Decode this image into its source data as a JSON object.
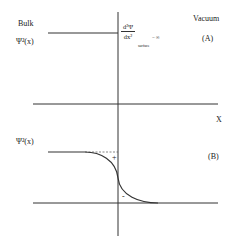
{
  "panel_a": {
    "bulk_label": "Bulk",
    "y_label": "Ψ²(x)",
    "vacuum_label": "Vacuum",
    "panel_tag": "(A)",
    "equation": {
      "numerator": "d²Ψ",
      "denominator": "dx²",
      "subscript": "surface",
      "rhs": "= ∞"
    }
  },
  "panel_b": {
    "x_label": "X",
    "y_label": "Ψ²(x)",
    "panel_tag": "(B)",
    "plus_sign": "+",
    "minus_sign": "-"
  },
  "colors": {
    "line": "#333333",
    "dashed": "#555555",
    "text": "#222222"
  }
}
